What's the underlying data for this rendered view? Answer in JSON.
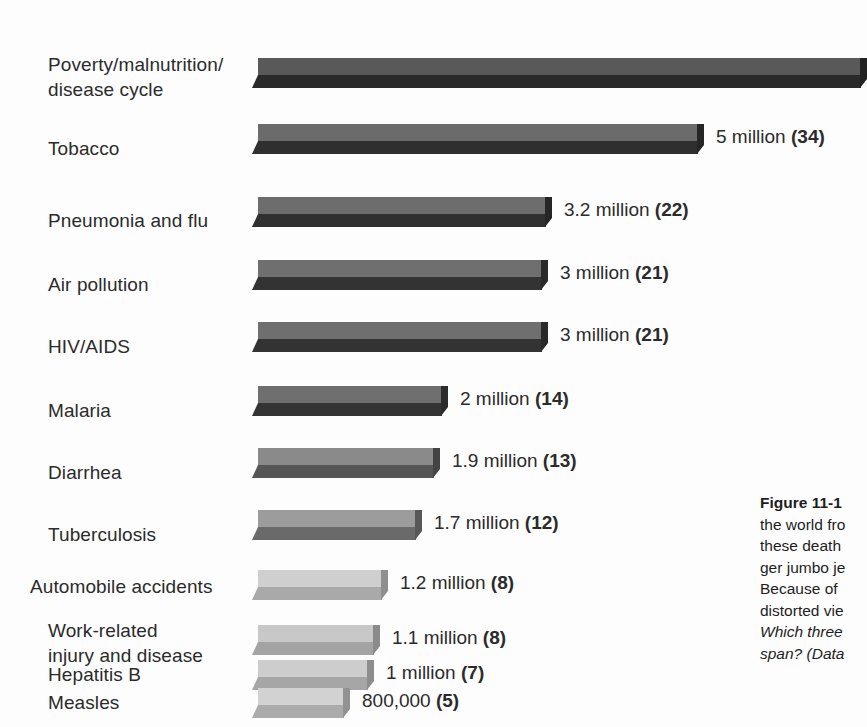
{
  "chart_data": {
    "type": "bar",
    "title": "",
    "orientation": "horizontal",
    "xlabel": "",
    "ylabel": "",
    "units": "deaths per year",
    "categories": [
      "Poverty/malnutrition/\ndisease cycle",
      "Tobacco",
      "Pneumonia and flu",
      "Air pollution",
      "HIV/AIDS",
      "Malaria",
      "Diarrhea",
      "Tuberculosis",
      "Automobile accidents",
      "Work-related\ninjury and disease",
      "Hepatitis B",
      "Measles"
    ],
    "values": [
      11000000,
      5000000,
      3200000,
      3000000,
      3000000,
      2000000,
      1900000,
      1700000,
      1200000,
      1100000,
      1000000,
      800000
    ],
    "value_labels": [
      "",
      "5  million (34)",
      "3.2 million (22)",
      "3 million (21)",
      "3 million (21)",
      "2 million (14)",
      "1.9 million (13)",
      "1.7 million (12)",
      "1.2 million (8)",
      "1.1 million (8)",
      "1 million (7)",
      "800,000 (5)"
    ],
    "value_main": [
      "",
      "5  million ",
      "3.2 million ",
      "3 million ",
      "3 million ",
      "2 million ",
      "1.9 million ",
      "1.7 million ",
      "1.2 million ",
      "1.1 million ",
      "1 million ",
      "800,000 "
    ],
    "value_paren": [
      "",
      "(34)",
      "(22)",
      "(21)",
      "(21)",
      "(14)",
      "(13)",
      "(12)",
      "(8)",
      "(8)",
      "(7)",
      "(5)"
    ],
    "bar_px_lengths": [
      615,
      452,
      300,
      296,
      296,
      196,
      188,
      170,
      136,
      128,
      122,
      98
    ],
    "bar_shades_top": [
      "#595959",
      "#6b6b6b",
      "#6d6d6d",
      "#6f6f6f",
      "#6f6f6f",
      "#6f6f6f",
      "#8a8a8a",
      "#9c9c9c",
      "#cfcfcf",
      "#c8c8c8",
      "#cdcdcd",
      "#d2d2d2"
    ],
    "bar_shades_front": [
      "#2a2a2a",
      "#2f2f2f",
      "#303030",
      "#333333",
      "#333333",
      "#343434",
      "#565656",
      "#6a6a6a",
      "#a9a9a9",
      "#a3a3a3",
      "#a6a6a6",
      "#ababab"
    ],
    "bar_shades_cap": [
      "#222222",
      "#262626",
      "#262626",
      "#292929",
      "#292929",
      "#2b2b2b",
      "#444444",
      "#575757",
      "#8f8f8f",
      "#8b8b8b",
      "#8d8d8d",
      "#929292"
    ],
    "legend": [],
    "grid": false,
    "note": "Parenthetical numbers are percent-scale rank values shown in bold"
  },
  "caption": {
    "head": "Figure 11-1",
    "line1": "the world fro",
    "line2": "these death",
    "line3": "ger jumbo je",
    "line4": "Because of",
    "line5": "distorted vie",
    "line6": "Which three",
    "line7": "span? (Data"
  }
}
